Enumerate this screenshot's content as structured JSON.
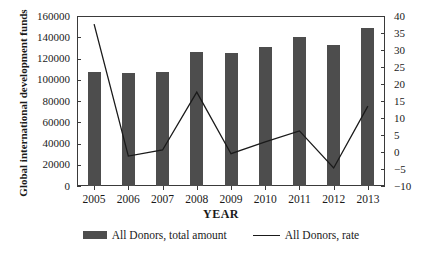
{
  "chart_data": {
    "type": "bar",
    "title": "",
    "xlabel": "YEAR",
    "ylabel": "Global international development funds",
    "ylabel_right": "Annual change rate",
    "categories": [
      "2005",
      "2006",
      "2007",
      "2008",
      "2009",
      "2010",
      "2011",
      "2012",
      "2013"
    ],
    "ylim": [
      0,
      160000
    ],
    "ylim_right": [
      -10,
      40
    ],
    "yticks": [
      "0",
      "20000",
      "40000",
      "60000",
      "80000",
      "100000",
      "120000",
      "140000",
      "160000"
    ],
    "yticks_right": [
      "-10",
      "-5",
      "0",
      "5",
      "10",
      "15",
      "20",
      "25",
      "30",
      "35",
      "40"
    ],
    "grid": false,
    "legend_position": "bottom",
    "series": [
      {
        "name": "All Donors, total amount",
        "type": "bar",
        "axis": "left",
        "color": "#4d4d4d",
        "values": [
          107500,
          106000,
          107000,
          126500,
          125000,
          130500,
          140000,
          132500,
          149000
        ]
      },
      {
        "name": "All Donors, rate",
        "type": "line",
        "axis": "right",
        "color": "#1a1a1a",
        "values": [
          37.6,
          -1.2,
          0.6,
          17.6,
          -0.5,
          3.0,
          6.2,
          -4.7,
          13.5
        ]
      }
    ]
  },
  "legend": {
    "items": [
      {
        "label": "All Donors, total amount",
        "marker": "bar-swatch"
      },
      {
        "label": "All Donors, rate",
        "marker": "line-swatch"
      }
    ]
  }
}
